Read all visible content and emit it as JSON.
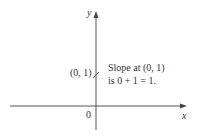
{
  "diagram": {
    "axes": {
      "x_label": "x",
      "y_label": "y",
      "origin_label": "0"
    },
    "point": {
      "label": "(0, 1)",
      "x": 0,
      "y": 1
    },
    "annotation": {
      "line1": "Slope at (0, 1)",
      "line2": "is 0 + 1 = 1."
    },
    "colors": {
      "axis": "#555555",
      "text": "#333333"
    }
  }
}
